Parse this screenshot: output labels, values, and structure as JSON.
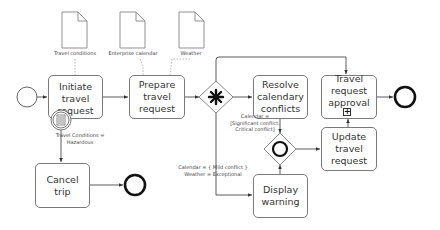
{
  "diagram": {
    "type": "BPMN process",
    "data_objects": [
      {
        "id": "doc-travel-conditions",
        "label": "Travel conditions"
      },
      {
        "id": "doc-enterprise-calendar",
        "label": "Enterprise calendar"
      },
      {
        "id": "doc-weather",
        "label": "Weather"
      }
    ],
    "tasks": {
      "initiate": "Initiate travel request",
      "prepare": "Prepare travel request",
      "resolve": "Resolve calendary conflicts",
      "approval": "Travel request approval",
      "update": "Update travel request",
      "warning": "Display warning",
      "cancel": "Cancel trip"
    },
    "conditions": {
      "hazardous_line1": "Travel Conditions =",
      "hazardous_line2": "Hazardous",
      "significant_line1": "Calendar =",
      "significant_line2": "[Significant conflict,",
      "significant_line3": "Critical conflict]",
      "mild_line1": "Calendar = { Mild conflict }",
      "mild_line2": "Weather = Exceptional"
    },
    "subprocess_marker": "+",
    "gateways": [
      {
        "id": "complex-gateway",
        "marker": "asterisk"
      },
      {
        "id": "inclusive-gateway",
        "marker": "circle"
      }
    ],
    "events": [
      {
        "id": "start-event",
        "type": "start"
      },
      {
        "id": "end-event-approval",
        "type": "end"
      },
      {
        "id": "end-event-cancel",
        "type": "end"
      },
      {
        "id": "conditional-boundary-event",
        "type": "conditional intermediate"
      }
    ],
    "colors": {
      "stroke": "#7a7a7a",
      "text": "#333333",
      "marker": "#111111"
    }
  }
}
